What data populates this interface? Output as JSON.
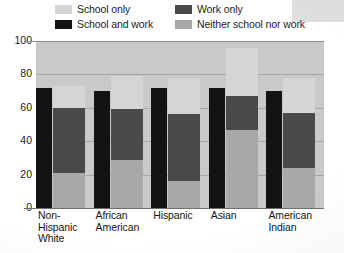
{
  "chart_data": {
    "type": "bar",
    "subtype": "stacked",
    "title": "",
    "xlabel": "",
    "ylabel": "",
    "ylim": [
      0,
      100
    ],
    "yticks": [
      0,
      20,
      40,
      60,
      80,
      100
    ],
    "grid": true,
    "legend_position": "top",
    "categories": [
      "Non-Hispanic White",
      "African American",
      "Hispanic",
      "Asian",
      "American Indian"
    ],
    "series": [
      {
        "name": "School only",
        "color": "#d5d5d5",
        "values": [
          13,
          20,
          22,
          29,
          21
        ]
      },
      {
        "name": "School and work",
        "color": "#131313",
        "values": [
          72,
          70,
          72,
          72,
          70
        ]
      },
      {
        "name": "Work only",
        "color": "#4a4a4a",
        "values": [
          39,
          30,
          40,
          20,
          33
        ]
      },
      {
        "name": "Neither school nor work",
        "color": "#a8a8a8",
        "values": [
          21,
          29,
          16,
          47,
          24
        ]
      }
    ],
    "stack_tops": {
      "wide_bar_total": [
        87,
        80,
        78,
        83,
        80
      ]
    },
    "legend": [
      {
        "label": "School only",
        "color": "#d5d5d5"
      },
      {
        "label": "Work only",
        "color": "#4a4a4a"
      },
      {
        "label": "School and work",
        "color": "#131313"
      },
      {
        "label": "Neither school nor work",
        "color": "#a8a8a8"
      }
    ]
  },
  "axis": {
    "y_ticks": [
      "100",
      "80",
      "60",
      "40",
      "20",
      "0"
    ]
  },
  "xaxis": {
    "labels": [
      "Non-\nHispanic\nWhite",
      "African\nAmerican",
      "Hispanic",
      "Asian",
      "American\nIndian"
    ]
  },
  "colors": {
    "plot_background": "#c9c9c9",
    "school_only": "#d5d5d5",
    "school_and_work": "#131313",
    "work_only": "#4a4a4a",
    "neither": "#a8a8a8",
    "gridline": "#9a9a9a",
    "text": "#1c1c1c"
  }
}
